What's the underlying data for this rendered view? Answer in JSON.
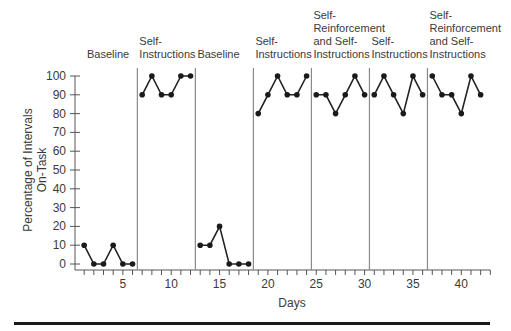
{
  "chart_data": {
    "type": "line",
    "title": "",
    "xlabel": "Days",
    "ylabel": "Percentage of Intervals On-Task",
    "ylabel_lines": [
      "Percentage of Intervals",
      "On-Task"
    ],
    "ylim": [
      0,
      100
    ],
    "xlim": [
      0,
      43
    ],
    "y_ticks": [
      0,
      10,
      20,
      30,
      40,
      50,
      60,
      70,
      80,
      90,
      100
    ],
    "x_tick_labels": [
      5,
      10,
      15,
      20,
      25,
      30,
      35,
      40
    ],
    "grid": false,
    "legend": null,
    "phases": [
      {
        "label_lines": [
          "Baseline"
        ],
        "days": [
          1,
          2,
          3,
          4,
          5,
          6
        ],
        "values": [
          10,
          0,
          0,
          10,
          0,
          0
        ]
      },
      {
        "label_lines": [
          "Self-",
          "Instructions"
        ],
        "days": [
          7,
          8,
          9,
          10,
          11,
          12
        ],
        "values": [
          90,
          100,
          90,
          90,
          100,
          100
        ]
      },
      {
        "label_lines": [
          "Baseline"
        ],
        "days": [
          13,
          14,
          15,
          16,
          17,
          18
        ],
        "values": [
          10,
          10,
          20,
          0,
          0,
          0
        ]
      },
      {
        "label_lines": [
          "Self-",
          "Instructions"
        ],
        "days": [
          19,
          20,
          21,
          22,
          23,
          24
        ],
        "values": [
          80,
          90,
          100,
          90,
          90,
          100
        ]
      },
      {
        "label_lines": [
          "Self-",
          "Reinforcement",
          "and Self-",
          "Instructions"
        ],
        "days": [
          25,
          26,
          27,
          28,
          29,
          30
        ],
        "values": [
          90,
          90,
          80,
          90,
          100,
          90
        ]
      },
      {
        "label_lines": [
          "Self-",
          "Instructions"
        ],
        "days": [
          31,
          32,
          33,
          34,
          35,
          36
        ],
        "values": [
          90,
          100,
          90,
          80,
          100,
          90
        ]
      },
      {
        "label_lines": [
          "Self-",
          "Reinforcement",
          "and Self-",
          "Instructions"
        ],
        "days": [
          37,
          38,
          39,
          40,
          41,
          42
        ],
        "values": [
          100,
          90,
          90,
          80,
          100,
          90
        ]
      }
    ],
    "phase_change_after_days": [
      6.5,
      12.5,
      18.5,
      24.5,
      30.5,
      36.5
    ]
  },
  "colors": {
    "data": "#1a1a1a",
    "phase_line": "#8a8a8a",
    "axis": "#555555",
    "text": "#3a3a3a"
  }
}
